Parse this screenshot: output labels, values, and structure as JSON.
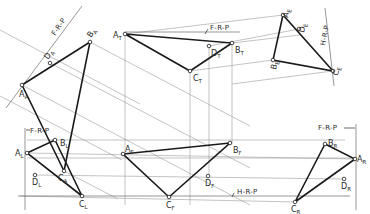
{
  "reference_planes": {
    "frp_auxiliary": "F-R-P",
    "frp_top": "F-R-P",
    "hrp_aux_e": "H-R-P",
    "frp_left": "F-R-P",
    "hrp_front": "H-R-P",
    "frp_right": "F-R-P"
  },
  "views": {
    "auxiliary_a": {
      "points": [
        {
          "name": "A",
          "sub": "A",
          "x": 22,
          "y": 85
        },
        {
          "name": "B",
          "sub": "A",
          "x": 90,
          "y": 42
        },
        {
          "name": "C",
          "sub": "A",
          "x": 64,
          "y": 171
        },
        {
          "name": "D",
          "sub": "A",
          "x": 50,
          "y": 63
        }
      ]
    },
    "top": {
      "points": [
        {
          "name": "A",
          "sub": "T",
          "x": 125,
          "y": 34
        },
        {
          "name": "B",
          "sub": "T",
          "x": 232,
          "y": 43
        },
        {
          "name": "C",
          "sub": "T",
          "x": 190,
          "y": 71
        },
        {
          "name": "D",
          "sub": "T",
          "x": 209,
          "y": 46
        }
      ]
    },
    "auxiliary_e": {
      "points": [
        {
          "name": "A",
          "sub": "E",
          "x": 283,
          "y": 15
        },
        {
          "name": "D",
          "sub": "E",
          "x": 299,
          "y": 29
        },
        {
          "name": "B",
          "sub": "E",
          "x": 273,
          "y": 60
        },
        {
          "name": "C",
          "sub": "E",
          "x": 333,
          "y": 71
        }
      ]
    },
    "left": {
      "points": [
        {
          "name": "A",
          "sub": "L",
          "x": 27,
          "y": 153
        },
        {
          "name": "B",
          "sub": "L",
          "x": 55,
          "y": 140
        },
        {
          "name": "D",
          "sub": "L",
          "x": 35,
          "y": 175
        },
        {
          "name": "C",
          "sub": "L",
          "x": 82,
          "y": 196
        }
      ]
    },
    "front": {
      "points": [
        {
          "name": "A",
          "sub": "F",
          "x": 123,
          "y": 154
        },
        {
          "name": "B",
          "sub": "F",
          "x": 230,
          "y": 143
        },
        {
          "name": "D",
          "sub": "F",
          "x": 208,
          "y": 176
        },
        {
          "name": "C",
          "sub": "F",
          "x": 169,
          "y": 197
        }
      ]
    },
    "right": {
      "points": [
        {
          "name": "B",
          "sub": "R",
          "x": 325,
          "y": 144
        },
        {
          "name": "A",
          "sub": "R",
          "x": 355,
          "y": 159
        },
        {
          "name": "D",
          "sub": "R",
          "x": 344,
          "y": 179
        },
        {
          "name": "C",
          "sub": "R",
          "x": 295,
          "y": 202
        }
      ]
    }
  },
  "labels": {
    "A_A": {
      "main": "A",
      "sub": "A"
    },
    "B_A": {
      "main": "B",
      "sub": "A"
    },
    "C_A": {
      "main": "C",
      "sub": "A"
    },
    "D_A": {
      "main": "D",
      "sub": "A"
    },
    "A_T": {
      "main": "A",
      "sub": "T"
    },
    "B_T": {
      "main": "B",
      "sub": "T"
    },
    "C_T": {
      "main": "C",
      "sub": "T"
    },
    "D_T": {
      "main": "D",
      "sub": "T"
    },
    "A_E": {
      "main": "A",
      "sub": "E"
    },
    "D_E": {
      "main": "D",
      "sub": "E"
    },
    "B_E": {
      "main": "B",
      "sub": "E"
    },
    "C_E": {
      "main": "C",
      "sub": "E"
    },
    "A_L": {
      "main": "A",
      "sub": "L"
    },
    "B_L": {
      "main": "B",
      "sub": "L"
    },
    "C_L": {
      "main": "C",
      "sub": "L"
    },
    "D_L": {
      "main": "D",
      "sub": "L"
    },
    "A_F": {
      "main": "A",
      "sub": "F"
    },
    "B_F": {
      "main": "B",
      "sub": "F"
    },
    "C_F": {
      "main": "C",
      "sub": "F"
    },
    "D_F": {
      "main": "D",
      "sub": "F"
    },
    "A_R": {
      "main": "A",
      "sub": "R"
    },
    "B_R": {
      "main": "B",
      "sub": "R"
    },
    "C_R": {
      "main": "C",
      "sub": "R"
    },
    "D_R": {
      "main": "D",
      "sub": "R"
    }
  },
  "colors": {
    "background": "#ffffff",
    "edge": "#1a1a1a",
    "projection": "#9a9a9a",
    "text": "#2a2a2a"
  }
}
